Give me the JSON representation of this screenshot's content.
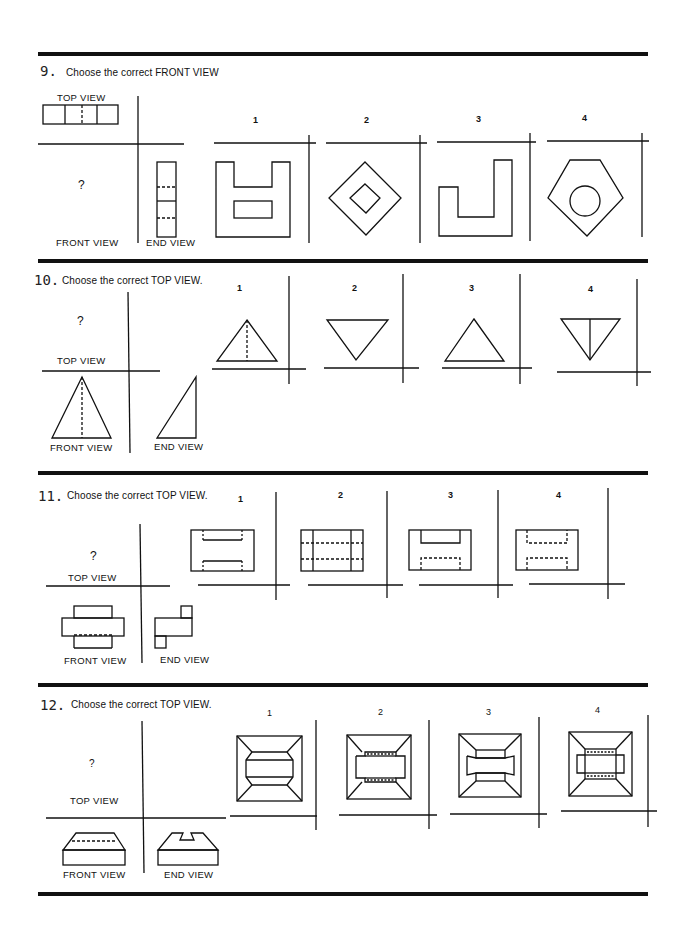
{
  "worksheet": {
    "problems": [
      {
        "number": "9.",
        "prompt": "Choose the correct FRONT VIEW",
        "question_mark": "?",
        "given_view_labels": {
          "top": "TOP VIEW",
          "front": "FRONT VIEW",
          "end": "END VIEW"
        },
        "options": [
          {
            "label": "1",
            "shape": "u-block-with-slot"
          },
          {
            "label": "2",
            "shape": "nested-diamonds"
          },
          {
            "label": "3",
            "shape": "j-profile"
          },
          {
            "label": "4",
            "shape": "pentagon-with-circle"
          }
        ]
      },
      {
        "number": "10.",
        "prompt": "Choose the correct TOP VIEW.",
        "question_mark": "?",
        "given_view_labels": {
          "top": "TOP VIEW",
          "front": "FRONT VIEW",
          "end": "END VIEW"
        },
        "options": [
          {
            "label": "1",
            "shape": "triangle-up-with-hidden-centerline"
          },
          {
            "label": "2",
            "shape": "triangle-down"
          },
          {
            "label": "3",
            "shape": "triangle-up"
          },
          {
            "label": "4",
            "shape": "triangle-down-with-centerline"
          }
        ]
      },
      {
        "number": "11.",
        "prompt": "Choose the correct TOP VIEW.",
        "question_mark": "?",
        "given_view_labels": {
          "top": "TOP VIEW",
          "front": "FRONT VIEW",
          "end": "END VIEW"
        },
        "options": [
          {
            "label": "1",
            "shape": "rect-two-slots"
          },
          {
            "label": "2",
            "shape": "rect-hidden-bands"
          },
          {
            "label": "3",
            "shape": "rect-visible-notch-hidden-notch"
          },
          {
            "label": "4",
            "shape": "rect-two-hidden-notches"
          }
        ]
      },
      {
        "number": "12.",
        "prompt": "Choose the correct TOP VIEW.",
        "question_mark": "?",
        "given_view_labels": {
          "top": "TOP VIEW",
          "front": "FRONT VIEW",
          "end": "END VIEW"
        },
        "options": [
          {
            "label": "1",
            "shape": "frustum-octagon-band"
          },
          {
            "label": "2",
            "shape": "frustum-hidden-slots"
          },
          {
            "label": "3",
            "shape": "frustum-channel"
          },
          {
            "label": "4",
            "shape": "frustum-hidden-box"
          }
        ]
      }
    ]
  }
}
